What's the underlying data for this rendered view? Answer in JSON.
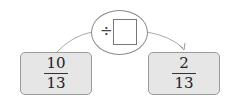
{
  "diagram": {
    "start": {
      "numerator": "10",
      "denominator": "13"
    },
    "operation": {
      "symbol": "÷",
      "operand": ""
    },
    "result": {
      "numerator": "2",
      "denominator": "13"
    },
    "colors": {
      "box_fill": "#e6e6e6",
      "box_border": "#9a9a9a",
      "line": "#999999"
    }
  }
}
